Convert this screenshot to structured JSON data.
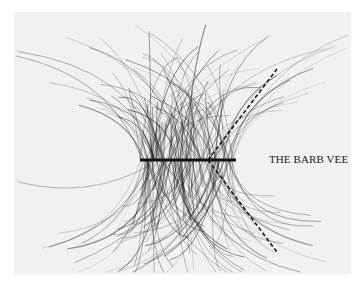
{
  "figure": {
    "caption": "THE BARB VEE",
    "colors": {
      "page_background": "#ffffff",
      "photo_background": "#f1f1f1",
      "barbs": "#2a2a2a",
      "stem": "#111111",
      "dashed_lines": "#1a1a1a"
    },
    "stem": {
      "x1": 140,
      "y1": 160,
      "x2": 236,
      "y2": 160
    },
    "vee_lines": [
      {
        "name": "upper",
        "x1": 208,
        "y1": 160,
        "x2": 277,
        "y2": 69
      },
      {
        "name": "lower",
        "x1": 208,
        "y1": 160,
        "x2": 277,
        "y2": 252
      }
    ]
  }
}
